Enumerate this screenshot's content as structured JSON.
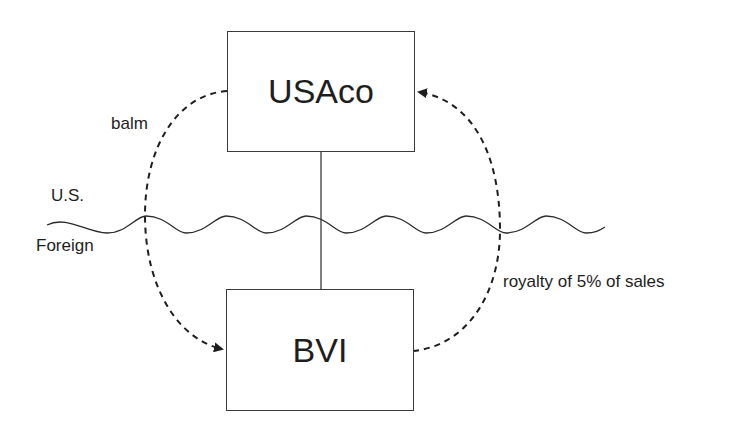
{
  "diagram": {
    "entities": [
      {
        "id": "usaco",
        "label": "USAco"
      },
      {
        "id": "bvi",
        "label": "BVI"
      }
    ],
    "labels": {
      "balm": "balm",
      "us": "U.S.",
      "foreign": "Foreign",
      "royalty": "royalty of 5% of sales"
    },
    "flows": [
      {
        "from": "USAco",
        "to": "BVI",
        "label": "balm",
        "style": "dashed-arrow"
      },
      {
        "from": "BVI",
        "to": "USAco",
        "label": "royalty of 5% of sales",
        "style": "dashed-arrow"
      }
    ],
    "ownership": {
      "parent": "USAco",
      "child": "BVI"
    },
    "border": {
      "above": "U.S.",
      "below": "Foreign"
    }
  }
}
